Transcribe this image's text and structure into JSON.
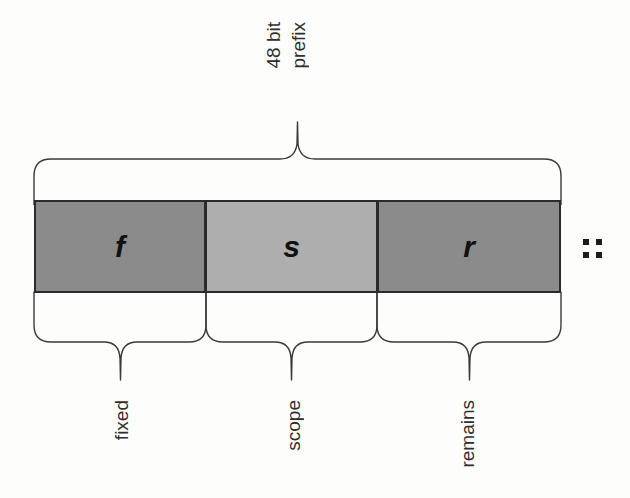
{
  "diagram": {
    "segments": [
      {
        "id": "f",
        "letter": "f",
        "label": "fixed",
        "fill": "#8b8b8b"
      },
      {
        "id": "s",
        "letter": "s",
        "label": "scope",
        "fill": "#aeaeae"
      },
      {
        "id": "r",
        "letter": "r",
        "label": "remains",
        "fill": "#8b8b8b"
      }
    ],
    "top_brace": {
      "label_line1": "48 bit",
      "label_line2": "prefix"
    },
    "separator": {
      "text": "::",
      "name": "double-colon-marker"
    },
    "colors": {
      "dark_gray": "#8b8b8b",
      "light_gray": "#aeaeae",
      "outline": "#2b2b2b",
      "brace_stroke": "#3a3a3a",
      "text": "#2e2e2e",
      "background": "#fdfdfc"
    }
  }
}
